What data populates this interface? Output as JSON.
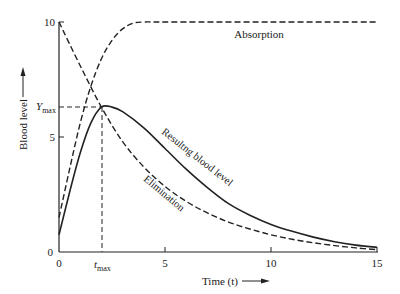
{
  "chart_data": {
    "type": "line",
    "title": "",
    "xlabel": "Time (t)",
    "ylabel": "Blood level",
    "xlim": [
      0,
      15
    ],
    "ylim": [
      0,
      10
    ],
    "x_ticks": [
      "0",
      "t_max",
      "5",
      "10",
      "15"
    ],
    "y_ticks": [
      "0",
      "5",
      "Y_max",
      "10"
    ],
    "grid": false,
    "annotations": {
      "t_max": 2.0,
      "Y_max": 6.3,
      "t_max_label": "t",
      "t_max_sub": "max",
      "Y_max_label": "Y",
      "Y_max_sub": "max"
    },
    "series": [
      {
        "name": "Absorption",
        "style": "dashed",
        "x": [
          0,
          0.5,
          1,
          1.5,
          2,
          2.5,
          3,
          3.5,
          4,
          5,
          10,
          15
        ],
        "y": [
          1.5,
          3.6,
          5.6,
          7.2,
          8.4,
          9.2,
          9.7,
          9.95,
          10,
          10,
          10,
          10
        ]
      },
      {
        "name": "Elimination",
        "style": "dashed",
        "x": [
          0,
          1,
          2,
          3,
          4,
          5,
          6,
          7,
          8,
          9,
          10,
          11,
          12,
          13,
          14,
          15
        ],
        "y": [
          10,
          8.1,
          6.3,
          4.8,
          3.7,
          2.85,
          2.2,
          1.7,
          1.3,
          1.0,
          0.75,
          0.55,
          0.4,
          0.28,
          0.18,
          0.1
        ]
      },
      {
        "name": "Resultng blood level",
        "style": "solid",
        "x": [
          0,
          0.5,
          1,
          1.5,
          2,
          2.5,
          3,
          4,
          5,
          6,
          7,
          8,
          9,
          10,
          11,
          12,
          13,
          14,
          15
        ],
        "y": [
          0.75,
          2.6,
          4.3,
          5.6,
          6.3,
          6.3,
          6.1,
          5.4,
          4.5,
          3.6,
          2.8,
          2.1,
          1.6,
          1.2,
          0.9,
          0.65,
          0.45,
          0.3,
          0.2
        ]
      }
    ]
  },
  "labels": {
    "absorption": "Absorption",
    "elimination": "Elimination",
    "resulting": "Resultng blood level",
    "x_axis": "Time (t)",
    "y_axis": "Blood level",
    "tick_0x": "0",
    "tick_5x": "5",
    "tick_10x": "10",
    "tick_15x": "15",
    "tick_0y": "0",
    "tick_5y": "5",
    "tick_10y": "10",
    "tmax_main": "t",
    "tmax_sub": "max",
    "ymax_main": "Y",
    "ymax_sub": "max"
  }
}
